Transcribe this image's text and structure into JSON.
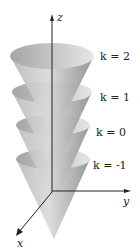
{
  "axes": {
    "z": "z",
    "y": "y",
    "x": "x"
  },
  "levels": [
    {
      "k": "k = 2",
      "top": 52
    },
    {
      "k": "k = 1",
      "top": 88
    },
    {
      "k": "k = 0",
      "top": 122
    },
    {
      "k": "k = -1",
      "top": 156
    }
  ],
  "colors": {
    "cone_dark": "#8f8f8f",
    "cone_light": "#d8d8d8",
    "axis": "#222222"
  }
}
